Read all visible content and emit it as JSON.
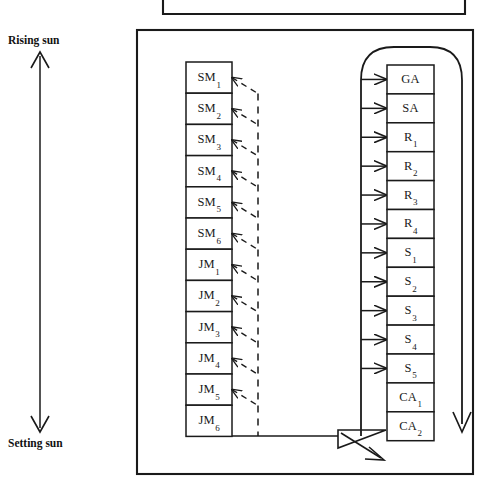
{
  "diagram": {
    "title_visible": false,
    "annotations": {
      "rising_sun": "Rising sun",
      "setting_sun": "Setting sun"
    },
    "left_column": {
      "name": "moon-months-column",
      "items": [
        {
          "base": "SM",
          "sub": "1",
          "text": "SM1"
        },
        {
          "base": "SM",
          "sub": "2",
          "text": "SM2"
        },
        {
          "base": "SM",
          "sub": "3",
          "text": "SM3"
        },
        {
          "base": "SM",
          "sub": "4",
          "text": "SM4"
        },
        {
          "base": "SM",
          "sub": "5",
          "text": "SM5"
        },
        {
          "base": "SM",
          "sub": "6",
          "text": "SM6"
        },
        {
          "base": "JM",
          "sub": "1",
          "text": "JM1"
        },
        {
          "base": "JM",
          "sub": "2",
          "text": "JM2"
        },
        {
          "base": "JM",
          "sub": "3",
          "text": "JM3"
        },
        {
          "base": "JM",
          "sub": "4",
          "text": "JM4"
        },
        {
          "base": "JM",
          "sub": "5",
          "text": "JM5"
        },
        {
          "base": "JM",
          "sub": "6",
          "text": "JM6"
        }
      ]
    },
    "right_column": {
      "name": "structures-column",
      "items": [
        {
          "base": "GA",
          "sub": "",
          "text": "GA"
        },
        {
          "base": "SA",
          "sub": "",
          "text": "SA"
        },
        {
          "base": "R",
          "sub": "1",
          "text": "R1"
        },
        {
          "base": "R",
          "sub": "2",
          "text": "R2"
        },
        {
          "base": "R",
          "sub": "3",
          "text": "R3"
        },
        {
          "base": "R",
          "sub": "4",
          "text": "R4"
        },
        {
          "base": "S",
          "sub": "1",
          "text": "S1"
        },
        {
          "base": "S",
          "sub": "2",
          "text": "S2"
        },
        {
          "base": "S",
          "sub": "3",
          "text": "S3"
        },
        {
          "base": "S",
          "sub": "4",
          "text": "S4"
        },
        {
          "base": "S",
          "sub": "5",
          "text": "S5"
        },
        {
          "base": "CA",
          "sub": "1",
          "text": "CA1"
        },
        {
          "base": "CA",
          "sub": "2",
          "text": "CA2"
        }
      ]
    },
    "colors": {
      "stroke": "#1a1a1a",
      "text": "#111111",
      "background": "#ffffff"
    },
    "geometry": {
      "top_partial_box": {
        "x": 163,
        "y": -20,
        "w": 302,
        "h": 34
      },
      "main_box": {
        "x": 137,
        "y": 30,
        "w": 336,
        "h": 444
      },
      "left_col": {
        "x": 186,
        "y": 62,
        "w": 46,
        "rows": 12,
        "row_h": 31.2
      },
      "right_col": {
        "x": 387,
        "y": 65,
        "w": 47,
        "rows": 13,
        "row_h": 28.9
      },
      "dashed_spine_x": 258,
      "arrow_spine_x": 361,
      "sun_axis_x": 40,
      "sun_axis_top": 52,
      "sun_axis_bottom": 430
    }
  }
}
